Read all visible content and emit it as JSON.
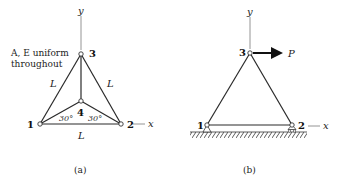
{
  "figure_a": {
    "caption": "(a)",
    "note_line1": "A, E uniform",
    "note_line2": "throughout",
    "axis_y_label": "y",
    "axis_x_label": "x",
    "nodes": [
      {
        "id": "1",
        "label": "1"
      },
      {
        "id": "2",
        "label": "2"
      },
      {
        "id": "3",
        "label": "3"
      },
      {
        "id": "4",
        "label": "4"
      }
    ],
    "member_labels": {
      "left": "L",
      "right": "L",
      "bottom": "L"
    },
    "angles": {
      "left": "30°",
      "right": "30°"
    }
  },
  "figure_b": {
    "caption": "(b)",
    "axis_y_label": "y",
    "axis_x_label": "x",
    "nodes": [
      {
        "id": "1",
        "label": "1"
      },
      {
        "id": "2",
        "label": "2"
      },
      {
        "id": "3",
        "label": "3"
      }
    ],
    "load_label": "P"
  },
  "colors": {
    "line": "#2a2a2a",
    "axis": "#888888",
    "background": "#ffffff"
  }
}
